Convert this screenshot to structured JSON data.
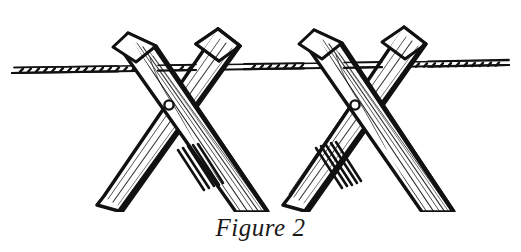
{
  "figure": {
    "caption": "Figure 2",
    "background_color": "#ffffff",
    "ink_color": "#111111"
  },
  "illustration": {
    "type": "line-art-diagram",
    "style": "pen-and-ink hatching with wood grain lines",
    "view_box": "0 0 521 212",
    "wire": {
      "name": "horizontal-wire",
      "y_center": 69,
      "x_start": 12,
      "x_end": 509,
      "thickness": 6,
      "texture": "barbed tick marks"
    },
    "crossings": [
      {
        "name": "stake-crossing-left",
        "nail_cx": 169,
        "nail_cy": 105,
        "nail_r": 4.6,
        "front_stake": {
          "top_x": 128,
          "top_y": 33,
          "bottom_x": 245,
          "bottom_y": 208,
          "width": 25
        },
        "back_stake": {
          "top_x": 218,
          "top_y": 29,
          "bottom_x": 96,
          "bottom_y": 206,
          "width": 21
        }
      },
      {
        "name": "stake-crossing-right",
        "nail_cx": 355,
        "nail_cy": 105,
        "nail_r": 4.6,
        "front_stake": {
          "top_x": 314,
          "top_y": 30,
          "bottom_x": 431,
          "bottom_y": 208,
          "width": 25
        },
        "back_stake": {
          "top_x": 404,
          "top_y": 27,
          "bottom_x": 282,
          "bottom_y": 206,
          "width": 21
        }
      }
    ]
  }
}
